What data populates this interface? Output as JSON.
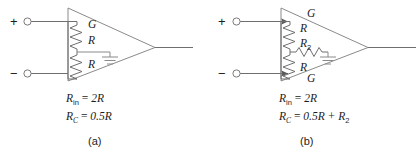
{
  "figure": {
    "panels": [
      {
        "id": "a",
        "caption": "(a)",
        "terminals": {
          "plus": "+",
          "minus": "−"
        },
        "components": [
          {
            "name": "gain-label",
            "label": "G"
          },
          {
            "name": "resistor-top",
            "label": "R"
          },
          {
            "name": "resistor-bottom",
            "label": "R"
          },
          {
            "name": "ground",
            "label": ""
          }
        ],
        "equations": [
          {
            "lhs": "R",
            "lhs_sub": "in",
            "rhs": "2R"
          },
          {
            "lhs": "R",
            "lhs_sub": "C",
            "rhs": "0.5R"
          }
        ]
      },
      {
        "id": "b",
        "caption": "(b)",
        "terminals": {
          "plus": "+",
          "minus": "−"
        },
        "components": [
          {
            "name": "gain-label-top",
            "label": "G"
          },
          {
            "name": "resistor-top",
            "label": "R"
          },
          {
            "name": "resistor-series",
            "label": "R",
            "sub": "2"
          },
          {
            "name": "resistor-bottom",
            "label": "R"
          },
          {
            "name": "gain-label-bottom",
            "label": "G"
          },
          {
            "name": "ground",
            "label": ""
          }
        ],
        "equations": [
          {
            "lhs": "R",
            "lhs_sub": "in",
            "rhs": "2R"
          },
          {
            "lhs": "R",
            "lhs_sub": "C",
            "rhs": "0.5R + R",
            "rhs_sub": "2"
          }
        ]
      }
    ],
    "colors": {
      "line": "#6f6f6f",
      "line_light": "#8a8a8a",
      "text": "#1c1c1c",
      "background": "#ffffff"
    }
  }
}
